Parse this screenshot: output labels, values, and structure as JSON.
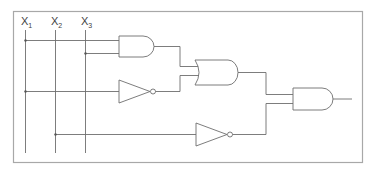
{
  "diagram": {
    "type": "logic-circuit",
    "inputs": [
      {
        "id": "x1",
        "label": "X",
        "subscript": "1"
      },
      {
        "id": "x2",
        "label": "X",
        "subscript": "2"
      },
      {
        "id": "x3",
        "label": "X",
        "subscript": "3"
      }
    ],
    "gates": [
      {
        "id": "and1",
        "type": "AND",
        "inputs": [
          "x1",
          "x3"
        ]
      },
      {
        "id": "not1",
        "type": "NOT",
        "inputs": [
          "x1"
        ]
      },
      {
        "id": "or1",
        "type": "OR",
        "inputs": [
          "and1",
          "not1"
        ]
      },
      {
        "id": "not2",
        "type": "NOT",
        "inputs": [
          "x2"
        ]
      },
      {
        "id": "and2",
        "type": "AND",
        "inputs": [
          "or1",
          "not2"
        ]
      }
    ],
    "output": {
      "from": "and2"
    },
    "colors": {
      "wire": "#6e6e6e",
      "frame": "#a8a8a8",
      "background": "#ffffff"
    }
  }
}
